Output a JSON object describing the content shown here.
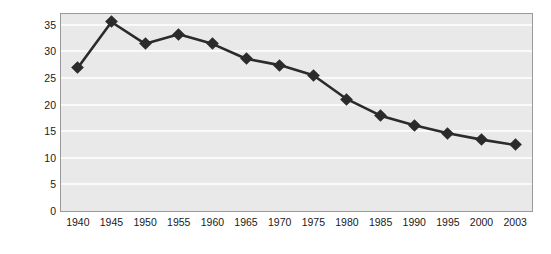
{
  "chart_data": {
    "type": "line",
    "title": "",
    "xlabel": "",
    "ylabel": "Percentage of  abor force",
    "categories": [
      "1940",
      "1945",
      "1950",
      "1955",
      "1960",
      "1965",
      "1970",
      "1975",
      "1980",
      "1985",
      "1990",
      "1995",
      "2000",
      "2003"
    ],
    "x": [
      1940,
      1945,
      1950,
      1955,
      1960,
      1965,
      1970,
      1975,
      1980,
      1985,
      1990,
      1995,
      2000,
      2003
    ],
    "values": [
      26.9,
      35.5,
      31.4,
      33.2,
      31.4,
      28.6,
      27.4,
      25.5,
      21.0,
      17.9,
      16.1,
      14.6,
      13.4,
      12.4
    ],
    "ylim": [
      0,
      37
    ],
    "yticks": [
      0,
      5,
      10,
      15,
      20,
      25,
      30,
      35
    ],
    "ytick_labels": [
      "0",
      "5",
      "10",
      "15",
      "20",
      "25",
      "30",
      "35"
    ],
    "grid": true,
    "grid_color": "#fafafa",
    "legend": null,
    "series_color": "#2b2b2b",
    "marker": "diamond",
    "plot_background": "#e9e9e9",
    "page_background": "#ffffff"
  }
}
